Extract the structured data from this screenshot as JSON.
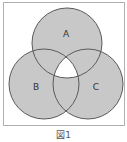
{
  "diagram": {
    "type": "venn",
    "sets": [
      {
        "label": "A",
        "cx": 67,
        "cy": 43,
        "r": 35
      },
      {
        "label": "B",
        "cx": 44,
        "cy": 84,
        "r": 35
      },
      {
        "label": "C",
        "cx": 88,
        "cy": 84,
        "r": 35
      }
    ],
    "shaded": "union minus triple intersection",
    "unshaded_region": "A∩B∩C",
    "colors": {
      "fill": "#c8c8c8",
      "stroke": "#5a5a5a",
      "frame": "#b0b0b0",
      "background": "#ffffff"
    }
  },
  "caption": "図1"
}
